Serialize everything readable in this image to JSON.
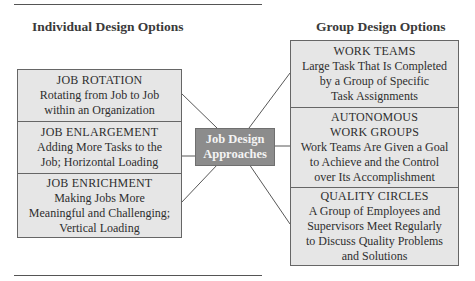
{
  "headings": {
    "left": "Individual Design Options",
    "right": "Group Design Options"
  },
  "center": {
    "line1": "Job Design",
    "line2": "Approaches",
    "bg_color": "#8c8c8c"
  },
  "individual_options": [
    {
      "title": "JOB ROTATION",
      "lines": [
        "Rotating from Job to Job",
        "within an Organization"
      ]
    },
    {
      "title": "JOB ENLARGEMENT",
      "lines": [
        "Adding More Tasks to the",
        "Job; Horizontal Loading"
      ]
    },
    {
      "title": "JOB ENRICHMENT",
      "lines": [
        "Making Jobs More",
        "Meaningful and Challenging;",
        "Vertical Loading"
      ]
    }
  ],
  "group_options": [
    {
      "title": "WORK TEAMS",
      "lines": [
        "Large Task That Is Completed",
        "by a Group of Specific",
        "Task Assignments"
      ]
    },
    {
      "title": "AUTONOMOUS",
      "title2": "WORK GROUPS",
      "lines": [
        "Work Teams Are Given a Goal",
        "to Achieve and the Control",
        "over Its Accomplishment"
      ]
    },
    {
      "title": "QUALITY CIRCLES",
      "lines": [
        "A Group of Employees and",
        "Supervisors Meet Regularly",
        "to Discuss Quality Problems",
        "and Solutions"
      ]
    }
  ],
  "colors": {
    "box_fill": "#e6e6e6",
    "border": "#666666",
    "center_fill": "#8c8c8c"
  }
}
